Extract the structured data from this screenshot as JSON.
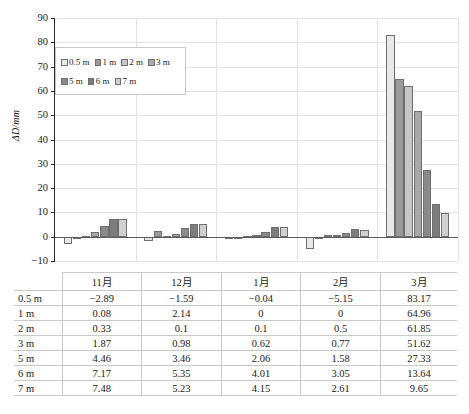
{
  "chart_data": {
    "type": "bar",
    "title": "",
    "xlabel": "",
    "ylabel": "ΔD/mm",
    "ylim": [
      -10,
      90
    ],
    "yticks": [
      90,
      80,
      70,
      60,
      50,
      40,
      30,
      20,
      10,
      0,
      -10
    ],
    "grid": true,
    "legend_position": "upper-left-inside",
    "categories": [
      "11月",
      "12月",
      "1月",
      "2月",
      "3月"
    ],
    "series": [
      {
        "name": "0.5 m",
        "color": "#e8e8e8",
        "values": [
          -2.89,
          -1.59,
          -0.04,
          -5.15,
          83.17
        ]
      },
      {
        "name": "1 m",
        "color": "#9a9a9a",
        "values": [
          0.08,
          2.14,
          0,
          0,
          64.96
        ]
      },
      {
        "name": "2 m",
        "color": "#c6c6c6",
        "values": [
          0.33,
          0.1,
          0.1,
          0.5,
          61.85
        ]
      },
      {
        "name": "3 m",
        "color": "#a8a8a8",
        "values": [
          1.87,
          0.98,
          0.62,
          0.77,
          51.62
        ]
      },
      {
        "name": "5 m",
        "color": "#8a8a8a",
        "values": [
          4.46,
          3.46,
          2.06,
          1.58,
          27.33
        ]
      },
      {
        "name": "6 m",
        "color": "#7d7d7d",
        "values": [
          7.17,
          5.35,
          4.01,
          3.05,
          13.64
        ]
      },
      {
        "name": "7 m",
        "color": "#d0d0d0",
        "values": [
          7.48,
          5.23,
          4.15,
          2.61,
          9.65
        ]
      }
    ]
  },
  "table": {
    "corner_label": "",
    "column_headers": [
      "11月",
      "12月",
      "1月",
      "2月",
      "3月"
    ],
    "rows": [
      {
        "label": "0.5 m",
        "values": [
          "−2.89",
          "−1.59",
          "−0.04",
          "−5.15",
          "83.17"
        ]
      },
      {
        "label": "1 m",
        "values": [
          "0.08",
          "2.14",
          "0",
          "0",
          "64.96"
        ]
      },
      {
        "label": "2 m",
        "values": [
          "0.33",
          "0.1",
          "0.1",
          "0.5",
          "61.85"
        ]
      },
      {
        "label": "3 m",
        "values": [
          "1.87",
          "0.98",
          "0.62",
          "0.77",
          "51.62"
        ]
      },
      {
        "label": "5 m",
        "values": [
          "4.46",
          "3.46",
          "2.06",
          "1.58",
          "27.33"
        ]
      },
      {
        "label": "6 m",
        "values": [
          "7.17",
          "5.35",
          "4.01",
          "3.05",
          "13.64"
        ]
      },
      {
        "label": "7 m",
        "values": [
          "7.48",
          "5.23",
          "4.15",
          "2.61",
          "9.65"
        ]
      }
    ]
  },
  "colors": {
    "axis": "#2b2b2b",
    "gridline": "#e2e2e2",
    "zero_line": "#5a5a5a",
    "bar_outline": "#6f6f6f",
    "table_border": "#c9c9c9"
  }
}
